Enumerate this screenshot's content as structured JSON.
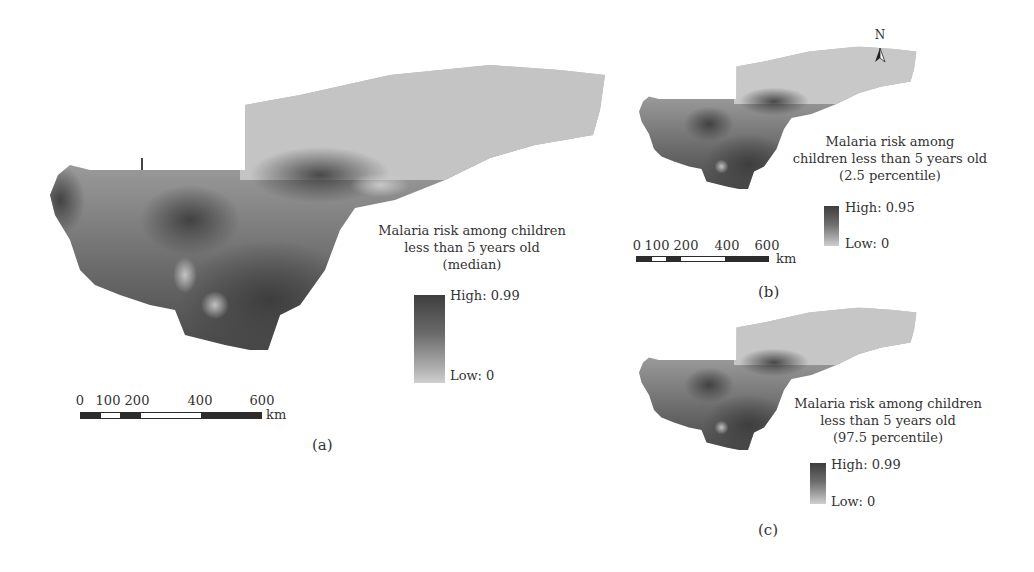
{
  "figure": {
    "panels": [
      {
        "id": "a",
        "label": "(a)",
        "legend": {
          "title_lines": [
            "Malaria risk among children",
            "less than 5 years old",
            "(median)"
          ],
          "high": "High: 0.99",
          "low": "Low: 0"
        },
        "scale_bar": {
          "ticks": [
            "0",
            "100",
            "200",
            "400",
            "600"
          ],
          "unit": "km"
        }
      },
      {
        "id": "b",
        "label": "(b)",
        "legend": {
          "title_lines": [
            "Malaria risk among",
            "children less than 5 years old",
            "(2.5 percentile)"
          ],
          "high": "High: 0.95",
          "low": "Low: 0"
        },
        "scale_bar": {
          "ticks": [
            "0",
            "100",
            "200",
            "400",
            "600"
          ],
          "unit": "km"
        },
        "north_arrow": "N"
      },
      {
        "id": "c",
        "label": "(c)",
        "legend": {
          "title_lines": [
            "Malaria risk among children",
            "less than 5 years old",
            "(97.5 percentile)"
          ],
          "high": "High: 0.99",
          "low": "Low: 0"
        }
      }
    ],
    "colors": {
      "risk_high": "#3e3e3e",
      "risk_mid": "#7a7a7a",
      "risk_low": "#cfcfcf",
      "north_low_risk": "#c4c4c4"
    }
  }
}
